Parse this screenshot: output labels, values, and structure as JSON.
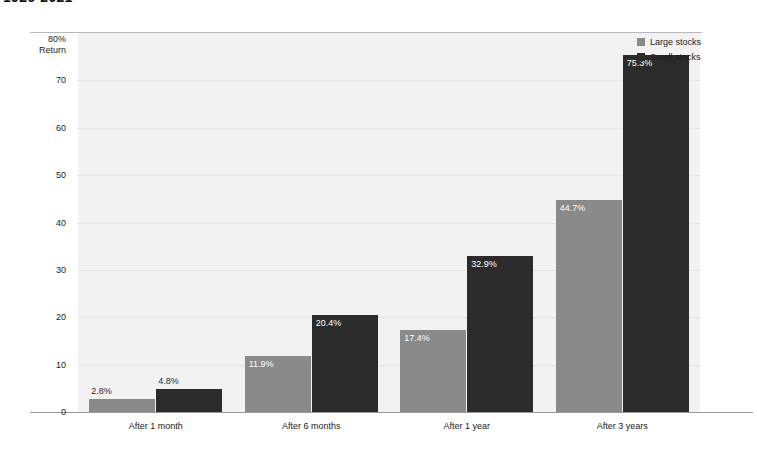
{
  "title": "1926-2021",
  "chart_data": {
    "type": "bar",
    "title": "1926-2021",
    "xlabel": "",
    "ylabel": "Return",
    "ylim": [
      0,
      80
    ],
    "yticks": [
      0,
      10,
      20,
      30,
      40,
      50,
      60,
      70,
      80
    ],
    "ytick_labels": [
      "0",
      "10",
      "20",
      "30",
      "40",
      "50",
      "60",
      "70",
      "80%\nReturn"
    ],
    "y_axis_top_label": "80%",
    "y_axis_top_sublabel": "Return",
    "grid": true,
    "grid_axis": "y",
    "legend_position": "top-right",
    "categories": [
      "After 1 month",
      "After 6 months",
      "After 1 year",
      "After 3 years"
    ],
    "series": [
      {
        "name": "Large stocks",
        "color": "#8a8a8a",
        "values": [
          2.8,
          11.9,
          17.4,
          44.7
        ],
        "labels": [
          "2.8%",
          "11.9%",
          "17.4%",
          "44.7%"
        ]
      },
      {
        "name": "Small stocks",
        "color": "#2b2b2b",
        "values": [
          4.8,
          20.4,
          32.9,
          75.3
        ],
        "labels": [
          "4.8%",
          "20.4%",
          "32.9%",
          "75.3%"
        ]
      }
    ]
  },
  "legend": {
    "items": [
      {
        "label": "Large stocks",
        "color": "#8a8a8a"
      },
      {
        "label": "Small stocks",
        "color": "#2b2b2b"
      }
    ]
  },
  "colors": {
    "large_stocks": "#8a8a8a",
    "small_stocks": "#2b2b2b",
    "plot_background": "#f2f2f2",
    "gridline": "#e2e2e2",
    "axis": "#9a9a9a"
  }
}
